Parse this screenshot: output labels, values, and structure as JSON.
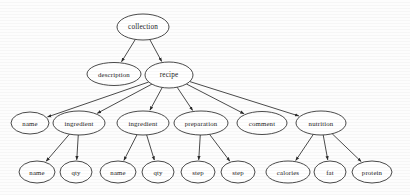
{
  "figure": {
    "ghost_caption": "",
    "background_color": "#fdfdfd",
    "node_fill": "#ffffff",
    "node_stroke": "#2b2b2b",
    "text_color": "#1b1b1b",
    "width": 410,
    "height": 195
  },
  "chart_data": {
    "type": "diagram",
    "subtype": "directed-tree",
    "orientation": "top-down",
    "node_shape": "ellipse",
    "edge_style": "straight-arrow",
    "levels": 4,
    "nodes": [
      {
        "id": "collection",
        "label": "collection",
        "level": 0,
        "cx": 143,
        "cy": 27,
        "rx": 26,
        "ry": 13,
        "font_size": 7.2
      },
      {
        "id": "description",
        "label": "description",
        "level": 1,
        "cx": 114,
        "cy": 74,
        "rx": 27,
        "ry": 11.5,
        "font_size": 6.8
      },
      {
        "id": "recipe",
        "label": "recipe",
        "level": 1,
        "cx": 169,
        "cy": 75,
        "rx": 24,
        "ry": 13,
        "font_size": 7.2
      },
      {
        "id": "name_top",
        "label": "name",
        "level": 2,
        "cx": 30,
        "cy": 123,
        "rx": 19,
        "ry": 11,
        "font_size": 6.8
      },
      {
        "id": "ingredient_1",
        "label": "ingredient",
        "level": 2,
        "cx": 79,
        "cy": 123,
        "rx": 26,
        "ry": 12,
        "font_size": 6.8
      },
      {
        "id": "ingredient_2",
        "label": "ingredient",
        "level": 2,
        "cx": 143,
        "cy": 123,
        "rx": 26,
        "ry": 12,
        "font_size": 6.8
      },
      {
        "id": "preparation",
        "label": "preparation",
        "level": 2,
        "cx": 201,
        "cy": 123,
        "rx": 27,
        "ry": 12,
        "font_size": 6.8
      },
      {
        "id": "comment",
        "label": "comment",
        "level": 2,
        "cx": 262,
        "cy": 123,
        "rx": 25,
        "ry": 11.5,
        "font_size": 6.8
      },
      {
        "id": "nutrition",
        "label": "nutrition",
        "level": 2,
        "cx": 321,
        "cy": 123,
        "rx": 25,
        "ry": 12,
        "font_size": 6.8
      },
      {
        "id": "name_i1",
        "label": "name",
        "level": 3,
        "cx": 37,
        "cy": 172,
        "rx": 18,
        "ry": 11,
        "font_size": 6.8
      },
      {
        "id": "qty_i1",
        "label": "qty",
        "level": 3,
        "cx": 76,
        "cy": 172,
        "rx": 16,
        "ry": 11,
        "font_size": 6.8
      },
      {
        "id": "name_i2",
        "label": "name",
        "level": 3,
        "cx": 118,
        "cy": 172,
        "rx": 18,
        "ry": 11,
        "font_size": 6.8
      },
      {
        "id": "qty_i2",
        "label": "qty",
        "level": 3,
        "cx": 158,
        "cy": 172,
        "rx": 16,
        "ry": 11,
        "font_size": 6.8
      },
      {
        "id": "step_1",
        "label": "step",
        "level": 3,
        "cx": 198,
        "cy": 172,
        "rx": 17,
        "ry": 11,
        "font_size": 6.8
      },
      {
        "id": "step_2",
        "label": "step",
        "level": 3,
        "cx": 238,
        "cy": 172,
        "rx": 17,
        "ry": 11,
        "font_size": 6.8
      },
      {
        "id": "calories",
        "label": "calories",
        "level": 3,
        "cx": 288,
        "cy": 172,
        "rx": 22,
        "ry": 11,
        "font_size": 6.8
      },
      {
        "id": "fat",
        "label": "fat",
        "level": 3,
        "cx": 330,
        "cy": 172,
        "rx": 16,
        "ry": 11,
        "font_size": 6.8
      },
      {
        "id": "protein",
        "label": "protein",
        "level": 3,
        "cx": 372,
        "cy": 172,
        "rx": 20,
        "ry": 11,
        "font_size": 6.8
      }
    ],
    "edges": [
      {
        "from": "collection",
        "to": "description"
      },
      {
        "from": "collection",
        "to": "recipe"
      },
      {
        "from": "recipe",
        "to": "name_top"
      },
      {
        "from": "recipe",
        "to": "ingredient_1"
      },
      {
        "from": "recipe",
        "to": "ingredient_2"
      },
      {
        "from": "recipe",
        "to": "preparation"
      },
      {
        "from": "recipe",
        "to": "comment"
      },
      {
        "from": "recipe",
        "to": "nutrition"
      },
      {
        "from": "ingredient_1",
        "to": "name_i1"
      },
      {
        "from": "ingredient_1",
        "to": "qty_i1"
      },
      {
        "from": "ingredient_2",
        "to": "name_i2"
      },
      {
        "from": "ingredient_2",
        "to": "qty_i2"
      },
      {
        "from": "preparation",
        "to": "step_1"
      },
      {
        "from": "preparation",
        "to": "step_2"
      },
      {
        "from": "nutrition",
        "to": "calories"
      },
      {
        "from": "nutrition",
        "to": "fat"
      },
      {
        "from": "nutrition",
        "to": "protein"
      }
    ]
  }
}
